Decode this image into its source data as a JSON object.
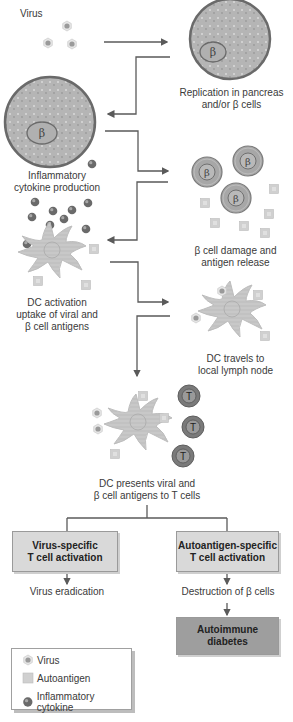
{
  "diagram": {
    "steps": {
      "virus": "Virus",
      "replication_line1": "Replication in pancreas",
      "replication_line2": "and/or β cells",
      "inflammatory_line1": "Inflammatory",
      "inflammatory_line2": "cytokine production",
      "damage_line1": "β cell damage and",
      "damage_line2": "antigen release",
      "dc_activation_line1": "DC activation",
      "dc_activation_line2": "uptake of viral and",
      "dc_activation_line3": "β cell antigens",
      "dc_travels_line1": "DC travels to",
      "dc_travels_line2": "local lymph node",
      "dc_presents_line1": "DC presents viral and",
      "dc_presents_line2": "β cell antigens to T cells"
    },
    "cell_labels": {
      "beta": "β",
      "t_cell": "T"
    },
    "boxes": {
      "virus_specific_line1": "Virus-specific",
      "virus_specific_line2": "T cell activation",
      "autoantigen_specific_line1": "Autoantigen-specific",
      "autoantigen_specific_line2": "T cell activation",
      "autoimmune_line1": "Autoimmune",
      "autoimmune_line2": "diabetes"
    },
    "outcomes": {
      "virus_eradication": "Virus eradication",
      "destruction": "Destruction of β cells"
    },
    "legend": {
      "items": [
        {
          "label": "Virus",
          "icon": "virus-icon"
        },
        {
          "label": "Autoantigen",
          "icon": "autoantigen-icon"
        },
        {
          "label": "Inflammatory cytokine",
          "icon": "cytokine-icon"
        }
      ]
    },
    "colors": {
      "arrow": "#5a5a5a",
      "cell_fill": "#b8b8b8",
      "cell_border": "#6e6e6e",
      "box_light": "#d9d9d9",
      "box_dark": "#9e9e9e",
      "text": "#3a3a3a"
    }
  }
}
